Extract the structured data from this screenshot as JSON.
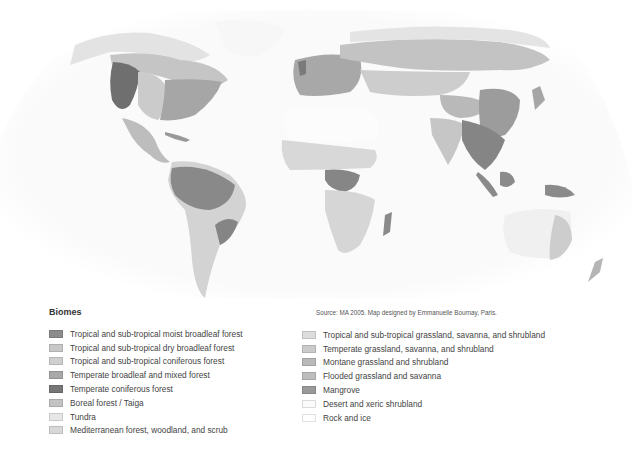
{
  "map": {
    "projection": "world-rounded",
    "ocean_color": "#ffffff",
    "land_outline": "#f4f4f4"
  },
  "legend": {
    "title": "Biomes",
    "source": "Source: MA 2005. Map designed by Emmanuelle Bournay, Paris.",
    "left_items": [
      {
        "label": "Tropical and sub-tropical moist broadleaf forest",
        "color": "#8c8c8c"
      },
      {
        "label": "Tropical and sub-tropical dry broadleaf forest",
        "color": "#c8c8c8"
      },
      {
        "label": "Tropical and sub-tropical coniferous forest",
        "color": "#cfcfcf"
      },
      {
        "label": "Temperate broadleaf and mixed forest",
        "color": "#a8a8a8"
      },
      {
        "label": "Temperate coniferous forest",
        "color": "#767676"
      },
      {
        "label": "Boreal forest / Taiga",
        "color": "#c3c3c3"
      },
      {
        "label": "Tundra",
        "color": "#e6e6e6"
      },
      {
        "label": "Mediterranean forest, woodland, and scrub",
        "color": "#d8d8d8"
      }
    ],
    "right_items": [
      {
        "label": "Tropical and sub-tropical grassland, savanna, and shrubland",
        "color": "#dcdcdc"
      },
      {
        "label": "Temperate grassland, savanna, and shrubland",
        "color": "#cbcbcb"
      },
      {
        "label": "Montane grassland and shrubland",
        "color": "#b9b9b9"
      },
      {
        "label": "Flooded grassland and savanna",
        "color": "#bdbdbd"
      },
      {
        "label": "Mangrove",
        "color": "#9a9a9a"
      },
      {
        "label": "Desert and xeric shrubland",
        "color": "#fbfbfb"
      },
      {
        "label": "Rock and ice",
        "color": "#ffffff"
      }
    ]
  }
}
